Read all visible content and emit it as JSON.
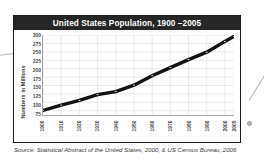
{
  "figure": {
    "title": "United States Population, 1900 –2005",
    "source": "Source: Statistical Abstract of the United States, 2000, & US Census Bureau, 2006"
  },
  "colors": {
    "title_bar": "#262626",
    "title_text": "#ffffff",
    "line": "#111111",
    "grid": "#d7d7d7",
    "axis": "#a8a8a8",
    "frame": "#1a1a1a",
    "callout_dot": "#b0b0b0",
    "marker": "#ffffff"
  },
  "chart_data": {
    "type": "line",
    "title": "United States Population, 1900 –2005",
    "xlabel": "",
    "ylabel": "Numbers in Millions",
    "x": [
      1900,
      1910,
      1920,
      1930,
      1940,
      1950,
      1960,
      1970,
      1980,
      1990,
      2000,
      2005
    ],
    "values": [
      76,
      92,
      106,
      123,
      132,
      151,
      179,
      203,
      227,
      249,
      281,
      296
    ],
    "series": [
      {
        "name": "United States Population",
        "values": [
          76,
          92,
          106,
          123,
          132,
          151,
          179,
          203,
          227,
          249,
          281,
          296
        ]
      }
    ],
    "categories": [
      "1900",
      "1910",
      "1920",
      "1930",
      "1940",
      "1950",
      "1960",
      "1970",
      "1980",
      "1990",
      "2000",
      "2005"
    ],
    "xticklabels": [
      "1900",
      "1910",
      "1920",
      "1930",
      "1940",
      "1950",
      "1960",
      "1970",
      "1980",
      "1990",
      "2000",
      "2005"
    ],
    "yticklabels": [
      "300",
      "275",
      "250",
      "225",
      "200",
      "175",
      "150",
      "125",
      "100",
      "75"
    ],
    "yticks": [
      300,
      275,
      250,
      225,
      200,
      175,
      150,
      125,
      100,
      75
    ],
    "ylim": [
      62.5,
      300
    ],
    "xlim": [
      1900,
      2005
    ],
    "grid": true,
    "legend": false,
    "markers": true,
    "line_width": "thick"
  }
}
